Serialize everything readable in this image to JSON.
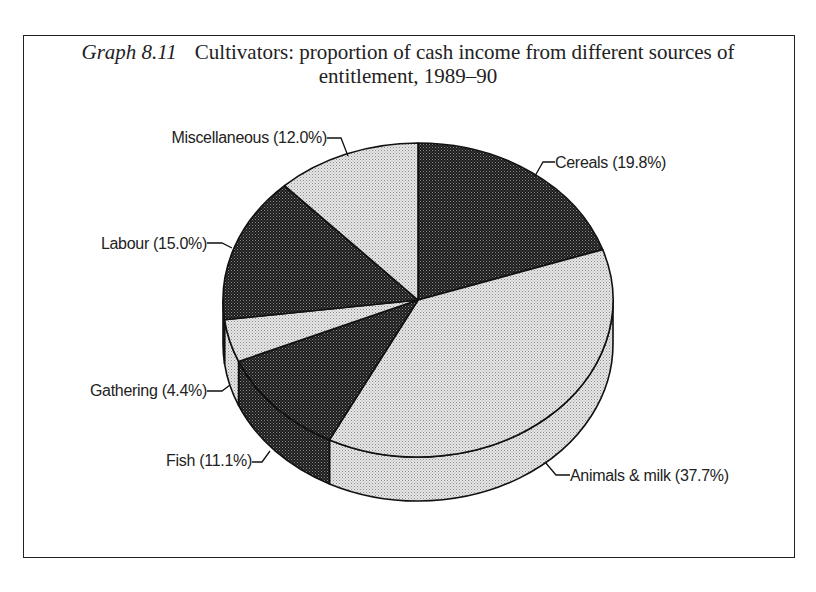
{
  "page": {
    "header_fragment": ""
  },
  "figure": {
    "label": "Graph 8.11",
    "title_line1": "Cultivators: proportion of cash income from different sources of",
    "title_line2": "entitlement, 1989–90"
  },
  "chart_data": {
    "type": "pie",
    "style": "3d",
    "title": "Cultivators: proportion of cash income from different sources of entitlement, 1989–90",
    "figure_label": "Graph 8.11",
    "unit": "%",
    "start_angle": "12 o'clock",
    "direction": "clockwise",
    "slices": [
      {
        "label": "Cereals",
        "value": 19.8,
        "display": "Cereals (19.8%)",
        "fill": "dark"
      },
      {
        "label": "Animals & milk",
        "value": 37.7,
        "display": "Animals & milk (37.7%)",
        "fill": "light"
      },
      {
        "label": "Fish",
        "value": 11.1,
        "display": "Fish (11.1%)",
        "fill": "dark"
      },
      {
        "label": "Gathering",
        "value": 4.4,
        "display": "Gathering (4.4%)",
        "fill": "light"
      },
      {
        "label": "Labour",
        "value": 15.0,
        "display": "Labour (15.0%)",
        "fill": "dark"
      },
      {
        "label": "Miscellaneous",
        "value": 12.0,
        "display": "Miscellaneous (12.0%)",
        "fill": "light"
      }
    ],
    "legend": "none (leader-line labels)",
    "colors": {
      "dark": "#2e2e2e",
      "light": "#d9d9d9",
      "outline": "#111111"
    }
  }
}
